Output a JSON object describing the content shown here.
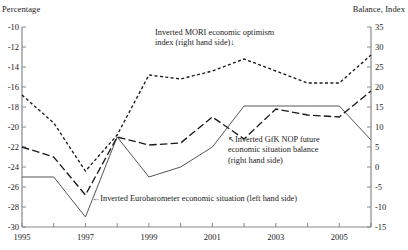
{
  "axis_titles": {
    "left": "Percentage",
    "right": "Balance, Index"
  },
  "annotations": {
    "mori_line1": "Inverted MORI economic optimism",
    "mori_line2": "index (right hand side)↓",
    "gfk_line1": "↖Inverted GfK NOP future",
    "gfk_line2": "economic situation balance",
    "gfk_line3": "(right hand side)",
    "euro": "←Inverted Eurobarometer economic situation (left hand side)"
  },
  "chart_data": {
    "type": "line",
    "title": "",
    "xlabel": "",
    "ylabel": "Percentage",
    "y2label": "Balance, Index",
    "grid": false,
    "legend_position": "inline-annotations",
    "x": [
      1995,
      1996,
      1997,
      1998,
      1999,
      2000,
      2001,
      2002,
      2003,
      2004,
      2005,
      2006
    ],
    "xlim": [
      1995,
      2006
    ],
    "xticks": [
      1995,
      1996,
      1997,
      1998,
      1999,
      2000,
      2001,
      2002,
      2003,
      2004,
      2005,
      2006
    ],
    "xtick_labels": [
      "1995",
      "",
      "1997",
      "",
      "1999",
      "",
      "2001",
      "",
      "2003",
      "",
      "2005",
      ""
    ],
    "ylim": [
      -30,
      -10
    ],
    "yticks": [
      -10,
      -12,
      -14,
      -16,
      -18,
      -20,
      -22,
      -24,
      -26,
      -28,
      -30
    ],
    "ytick_labels": [
      "-10",
      "-12",
      "-14",
      "-16",
      "-18",
      "-20",
      "-22",
      "-24",
      "-26",
      "-28",
      "-30"
    ],
    "y2lim": [
      -15,
      35
    ],
    "y2ticks": [
      35,
      30,
      25,
      20,
      15,
      10,
      5,
      0,
      -5,
      -10,
      -15
    ],
    "y2tick_labels": [
      "35",
      "30",
      "25",
      "20",
      "15",
      "10",
      "5",
      "0",
      "-5",
      "-10",
      "-15"
    ],
    "series": [
      {
        "name": "Inverted Eurobarometer economic situation (left hand side)",
        "axis": "left",
        "style": "solid",
        "color": "#555555",
        "values": [
          -25.0,
          -25.0,
          -29.0,
          -21.0,
          -25.0,
          -24.0,
          -22.0,
          -17.9,
          -17.9,
          -17.9,
          -17.9,
          -21.3
        ]
      },
      {
        "name": "Inverted MORI economic optimism index (right hand side)",
        "axis": "right",
        "style": "short-dash",
        "color": "#1a1a1a",
        "values": [
          18.0,
          11.0,
          -1.0,
          8.0,
          23.0,
          22.0,
          24.0,
          27.0,
          24.0,
          21.0,
          21.0,
          28.0
        ]
      },
      {
        "name": "Inverted GfK NOP future economic situation balance (right hand side)",
        "axis": "right",
        "style": "long-dash",
        "color": "#1a1a1a",
        "values": [
          5.0,
          2.5,
          -7.0,
          7.5,
          5.5,
          6.0,
          12.5,
          7.0,
          14.5,
          13.0,
          12.5,
          19.0
        ]
      }
    ]
  }
}
